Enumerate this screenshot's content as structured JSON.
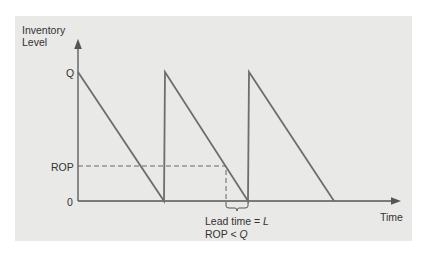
{
  "diagram": {
    "type": "sawtooth-inventory",
    "y_axis_label": [
      "Inventory",
      "Level"
    ],
    "x_axis_label": "Time",
    "y_ticks": {
      "q": "Q",
      "rop": "ROP",
      "zero": "0"
    },
    "annotation": {
      "lead_time_prefix": "Lead time = ",
      "lead_time_var": "L",
      "rop_prefix": "ROP < ",
      "rop_var": "Q"
    },
    "cycles": 3,
    "colors": {
      "panel": "#e9e9e7",
      "line": "#6e6e6e",
      "axis": "#555555",
      "text": "#333333"
    }
  }
}
